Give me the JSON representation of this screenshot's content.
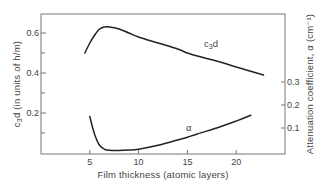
{
  "chart_data": {
    "type": "line",
    "title": "",
    "xlabel": "Film thickness (atomic layers)",
    "ylabel_left": "c3d (in units of h/m)",
    "ylabel_right": "Attenuation coefficient, α (cm⁻¹)",
    "xlim": [
      0,
      25
    ],
    "ylim_left": [
      0,
      0.7
    ],
    "ylim_right": [
      0,
      0.65
    ],
    "x_ticks": [
      5,
      10,
      15,
      20
    ],
    "y_left_ticks": [
      0.2,
      0.4,
      0.6
    ],
    "y_left_minor_ticks": [
      0.1,
      0.3,
      0.5
    ],
    "y_right_ticks": [
      0.1,
      0.2,
      0.3
    ],
    "grid": false,
    "legend": "inline curve labels",
    "series": [
      {
        "name": "c3d",
        "label": "c₃d",
        "axis": "left",
        "x": [
          4.5,
          5.0,
          5.5,
          6.0,
          6.5,
          7.0,
          8.0,
          9.0,
          10.0,
          12.0,
          14.0,
          15.0,
          16.0,
          18.0,
          20.0,
          22.8
        ],
        "y": [
          0.5,
          0.55,
          0.59,
          0.62,
          0.63,
          0.63,
          0.62,
          0.6,
          0.58,
          0.55,
          0.52,
          0.5,
          0.485,
          0.46,
          0.43,
          0.39
        ]
      },
      {
        "name": "alpha",
        "label": "α",
        "axis": "right",
        "x": [
          5.0,
          5.3,
          5.6,
          6.0,
          6.5,
          7.0,
          8.0,
          9.0,
          10.0,
          12.0,
          14.0,
          15.0,
          16.0,
          18.0,
          20.0,
          21.5
        ],
        "y": [
          0.15,
          0.1,
          0.06,
          0.025,
          0.008,
          0.003,
          0.002,
          0.004,
          0.008,
          0.025,
          0.048,
          0.06,
          0.074,
          0.1,
          0.13,
          0.155
        ]
      }
    ]
  }
}
